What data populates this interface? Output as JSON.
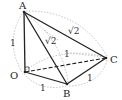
{
  "diagram": {
    "type": "tetrahedron",
    "points": {
      "A": {
        "label": "A",
        "x": 24,
        "y": 12
      },
      "O": {
        "label": "O",
        "x": 25,
        "y": 72
      },
      "B": {
        "label": "B",
        "x": 67,
        "y": 84
      },
      "C": {
        "label": "C",
        "x": 106,
        "y": 58
      }
    },
    "edge_labels": {
      "OA": "1",
      "AC": "√2",
      "AB": "√2",
      "OC": "1",
      "BC": "1",
      "OB": "1"
    },
    "right_angle_at": "O",
    "colors": {
      "edge": "#222222",
      "arc": "#999999"
    }
  }
}
